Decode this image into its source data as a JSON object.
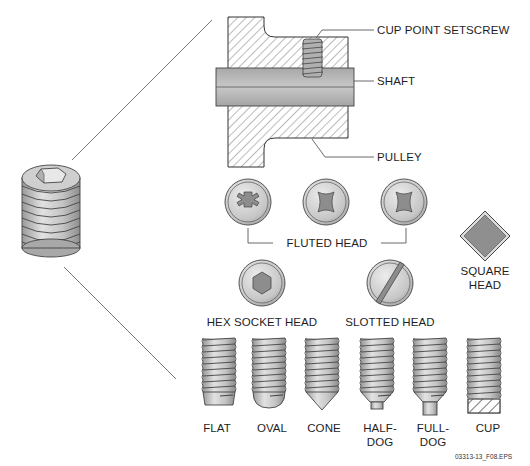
{
  "figure": {
    "caption": "03313-13_F08.EPS",
    "pulley_callouts": {
      "setscrew": "CUP POINT SETSCREW",
      "shaft": "SHAFT",
      "pulley": "PULLEY"
    },
    "head_types": {
      "fluted": "FLUTED HEAD",
      "square_line1": "SQUARE",
      "square_line2": "HEAD",
      "hex_socket": "HEX SOCKET HEAD",
      "slotted": "SLOTTED HEAD"
    },
    "point_types": [
      {
        "line1": "FLAT",
        "line2": ""
      },
      {
        "line1": "OVAL",
        "line2": ""
      },
      {
        "line1": "CONE",
        "line2": ""
      },
      {
        "line1": "HALF-",
        "line2": "DOG"
      },
      {
        "line1": "FULL-",
        "line2": "DOG"
      },
      {
        "line1": "CUP",
        "line2": ""
      }
    ],
    "colors": {
      "metal_light": "#d4d4d4",
      "metal_mid": "#b8b8b8",
      "metal_dark": "#8a8a8a",
      "outline": "#3a3a3a",
      "hatch": "#555555",
      "shaft": "#bdbdbd"
    }
  }
}
